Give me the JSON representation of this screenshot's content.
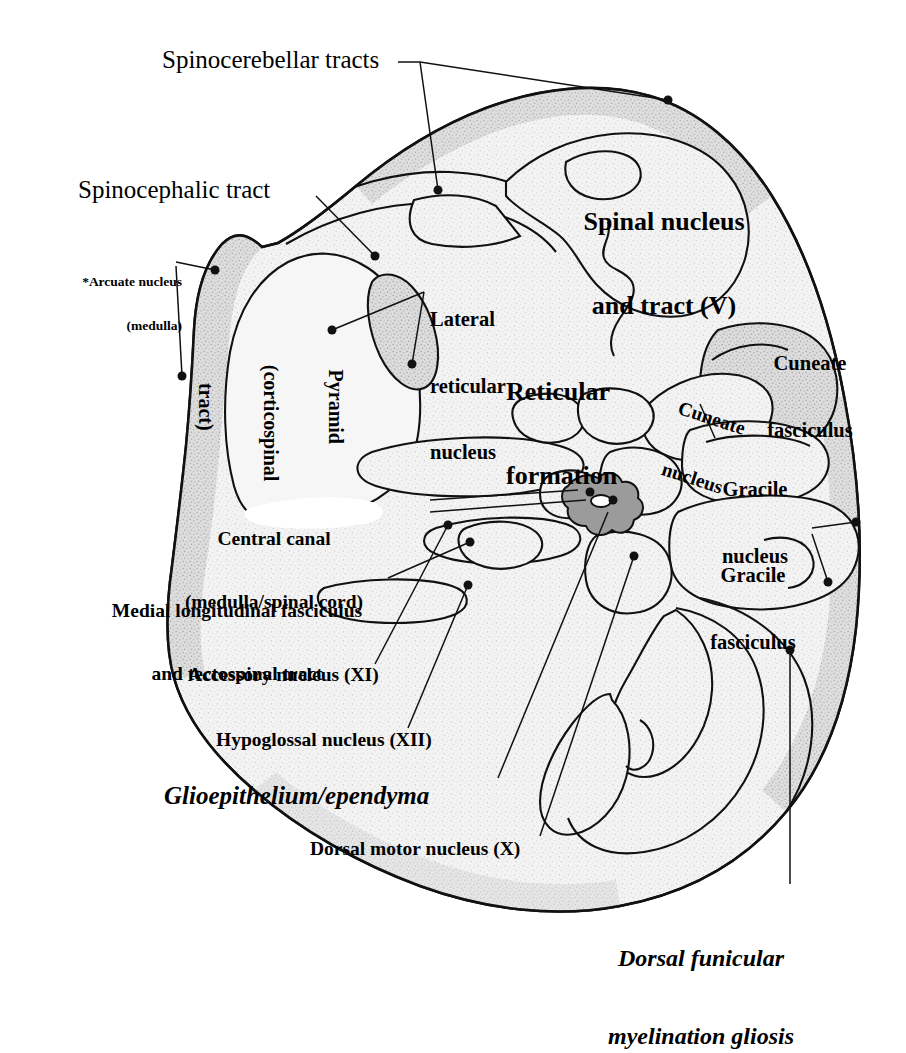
{
  "figure": {
    "colors": {
      "background": "#ffffff",
      "tissue_fill": "#f2f2f2",
      "tissue_speckle": "#b9b9b9",
      "tissue_dark_rim": "#cdcdcd",
      "outline": "#111111",
      "leader_line": "#111111",
      "central_canal_fill": "#8d8d8d",
      "text": "#000000"
    }
  },
  "labels": [
    {
      "id": "spinocerebellar-tracts",
      "text": "Spinocerebellar tracts",
      "style": "plain",
      "size": 23,
      "x": 162,
      "y": 50,
      "align": "left"
    },
    {
      "id": "spinocephalic-tract",
      "text": "Spinocephalic tract",
      "style": "plain",
      "size": 23,
      "x": 78,
      "y": 178,
      "align": "left"
    },
    {
      "id": "arcuate-nucleus",
      "line1": "*Arcuate nucleus",
      "line2": "(medulla)",
      "style": "bold",
      "size": 13,
      "x": 52,
      "y": 248,
      "align": "right",
      "width": 130
    },
    {
      "id": "pyramid-corticospinal-tract",
      "line1": "Pyramid",
      "line2": "(corticospinal",
      "line3": "tract)",
      "style": "bold",
      "size": 20,
      "rotated": true,
      "x": 268,
      "y": 300,
      "align": "center"
    },
    {
      "id": "lateral-reticular-nucleus",
      "line1": "Lateral",
      "line2": "reticular",
      "line3": "nucleus",
      "style": "bold",
      "size": 20,
      "x": 430,
      "y": 268,
      "align": "left"
    },
    {
      "id": "reticular-formation",
      "line1": "Reticular",
      "line2": "formation",
      "style": "bold",
      "size": 25,
      "x": 508,
      "y": 318,
      "align": "left"
    },
    {
      "id": "spinal-nucleus-and-tract-v",
      "line1": "Spinal nucleus",
      "line2": "and tract (V)",
      "style": "bold",
      "size": 25,
      "x": 572,
      "y": 156,
      "align": "left"
    },
    {
      "id": "cuneate-fasciculus",
      "line1": "Cuneate",
      "line2": "fasciculus",
      "style": "bold",
      "size": 20,
      "x": 758,
      "y": 312,
      "align": "left"
    },
    {
      "id": "cuneate-nucleus",
      "line1": "Cuneate",
      "line2": "nucleus",
      "style": "bold",
      "size": 19,
      "rotated_deg": -18,
      "x": 660,
      "y": 368,
      "align": "left"
    },
    {
      "id": "gracile-nucleus",
      "line1": "Gracile",
      "line2": "nucleus",
      "style": "bold",
      "size": 20,
      "x": 706,
      "y": 438,
      "align": "left"
    },
    {
      "id": "gracile-fasciculus",
      "line1": "Gracile",
      "line2": "fasciculus",
      "style": "bold",
      "size": 20,
      "x": 700,
      "y": 524,
      "align": "left"
    },
    {
      "id": "central-canal",
      "line1": "Central canal",
      "line2": "(medulla/spinal cord)",
      "style": "bold",
      "size": 19,
      "x": 124,
      "y": 490,
      "align": "left"
    },
    {
      "id": "medial-longitudinal-fasciculus",
      "line1": "Medial longitudinal fasciculus",
      "line2": "and tectospinal tract",
      "style": "bold",
      "size": 19,
      "x": 88,
      "y": 562,
      "align": "left"
    },
    {
      "id": "accessory-nucleus-xi",
      "text": "Accessory nucleus (XI)",
      "style": "bold",
      "size": 19,
      "x": 190,
      "y": 668,
      "align": "left"
    },
    {
      "id": "hypoglossal-nucleus-xii",
      "text": "Hypoglossal nucleus (XII)",
      "style": "bold",
      "size": 19,
      "x": 218,
      "y": 733,
      "align": "left"
    },
    {
      "id": "glioepithelium-ependyma",
      "text": "Glioepithelium/ependyma",
      "style": "bolditalic",
      "size": 23,
      "x": 166,
      "y": 786,
      "align": "left"
    },
    {
      "id": "dorsal-motor-nucleus-x",
      "text": "Dorsal motor nucleus (X)",
      "style": "bold",
      "size": 19,
      "x": 312,
      "y": 840,
      "align": "left"
    },
    {
      "id": "dorsal-funicular-myelination-gliosis",
      "line1": "Dorsal funicular",
      "line2": "myelination gliosis",
      "style": "bolditalic",
      "size": 23,
      "x": 585,
      "y": 898,
      "align": "left"
    }
  ],
  "leaders": [
    {
      "id": "leader-spinocerebellar-tracts-a",
      "from": [
        400,
        62
      ],
      "to": [
        668,
        100
      ]
    },
    {
      "id": "leader-spinocerebellar-tracts-b",
      "from": [
        400,
        62
      ],
      "to": [
        438,
        190
      ]
    },
    {
      "id": "leader-spinocephalic-tract",
      "from": [
        316,
        196
      ],
      "to": [
        375,
        256
      ]
    },
    {
      "id": "leader-arcuate-nucleus-a",
      "from": [
        182,
        268
      ],
      "to": [
        215,
        270
      ]
    },
    {
      "id": "leader-arcuate-nucleus-b",
      "from": [
        182,
        272
      ],
      "to": [
        176,
        372
      ]
    },
    {
      "id": "leader-lateral-reticular-nucleus",
      "from": [
        424,
        290
      ],
      "to": [
        330,
        328
      ]
    },
    {
      "id": "leader-cuneate-nucleus",
      "from": [
        700,
        404
      ],
      "to": [
        716,
        436
      ]
    },
    {
      "id": "leader-gracile-fasciculus-a",
      "from": [
        812,
        528
      ],
      "to": [
        856,
        522
      ]
    },
    {
      "id": "leader-gracile-fasciculus-b",
      "from": [
        812,
        534
      ],
      "to": [
        828,
        580
      ]
    },
    {
      "id": "leader-central-canal",
      "from": [
        430,
        503
      ],
      "to": [
        580,
        512
      ]
    },
    {
      "id": "leader-mlf-tectospinal",
      "from": [
        388,
        578
      ],
      "to": [
        468,
        543
      ]
    },
    {
      "id": "leader-accessory-nucleus",
      "from": [
        375,
        664
      ],
      "to": [
        445,
        524
      ]
    },
    {
      "id": "leader-hypoglossal-nucleus",
      "from": [
        410,
        728
      ],
      "to": [
        465,
        585
      ]
    },
    {
      "id": "leader-glioepithelium",
      "from": [
        500,
        778
      ],
      "to": [
        570,
        510
      ]
    },
    {
      "id": "leader-dorsal-motor-nucleus",
      "from": [
        540,
        836
      ],
      "to": [
        637,
        552
      ]
    },
    {
      "id": "leader-dorsal-funicular",
      "from": [
        790,
        884
      ],
      "to": [
        790,
        648
      ]
    }
  ],
  "structures": [
    {
      "id": "pyramid-region",
      "name": "Pyramid (corticospinal tract)"
    },
    {
      "id": "lateral-reticular-region",
      "name": "Lateral reticular nucleus"
    },
    {
      "id": "spinal-nucleus-region",
      "name": "Spinal nucleus and tract (V)"
    },
    {
      "id": "cuneate-nucleus-region",
      "name": "Cuneate nucleus"
    },
    {
      "id": "gracile-nucleus-region",
      "name": "Gracile nucleus"
    },
    {
      "id": "gracile-fasciculus-region",
      "name": "Gracile fasciculus"
    },
    {
      "id": "cuneate-fasciculus-region",
      "name": "Cuneate fasciculus"
    },
    {
      "id": "central-canal-region",
      "name": "Central canal"
    },
    {
      "id": "mlf-region",
      "name": "Medial longitudinal fasciculus"
    },
    {
      "id": "dorsal-horn-region",
      "name": "Dorsal horn / dorsal motor nucleus region"
    }
  ]
}
